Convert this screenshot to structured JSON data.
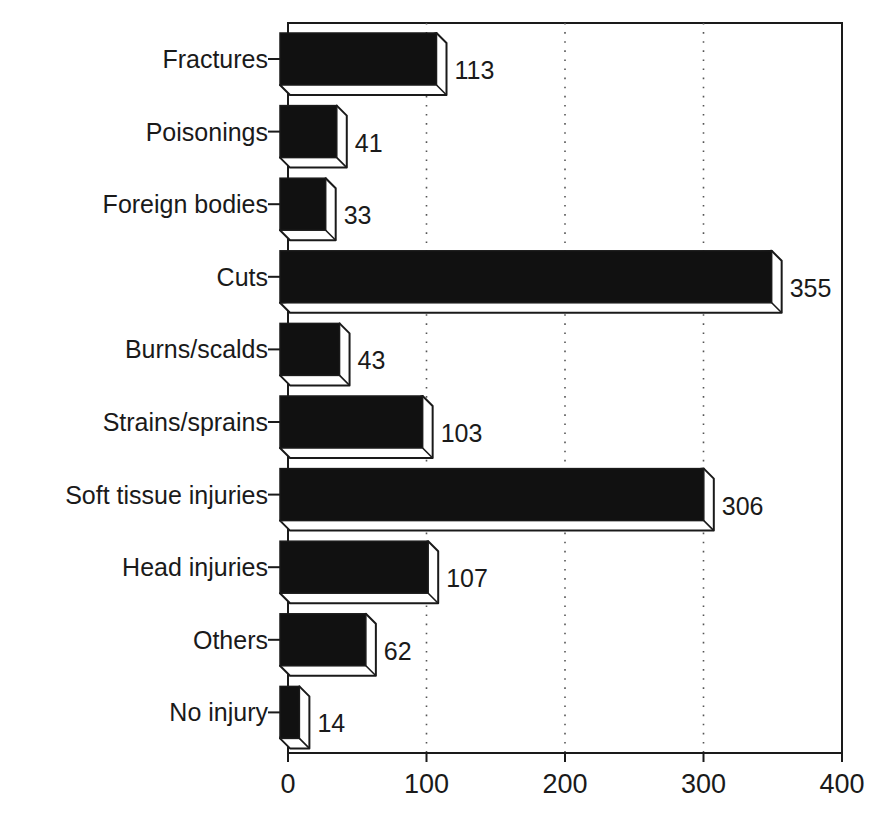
{
  "chart_data": {
    "type": "bar",
    "orientation": "horizontal",
    "style": "3d-bevel",
    "title": "",
    "xlabel": "",
    "ylabel": "",
    "categories": [
      "Fractures",
      "Poisonings",
      "Foreign bodies",
      "Cuts",
      "Burns/scalds",
      "Strains/sprains",
      "Soft tissue injuries",
      "Head injuries",
      "Others",
      "No injury"
    ],
    "values": [
      113,
      41,
      33,
      355,
      43,
      103,
      306,
      107,
      62,
      14
    ],
    "data_labels": [
      "113",
      "41",
      "33",
      "355",
      "43",
      "103",
      "306",
      "107",
      "62",
      "14"
    ],
    "xlim": [
      0,
      400
    ],
    "x_ticks": [
      0,
      100,
      200,
      300,
      400
    ],
    "x_tick_labels": [
      "0",
      "100",
      "200",
      "300",
      "400"
    ],
    "grid": {
      "vertical": true,
      "style": "dotted",
      "at": [
        100,
        200,
        300
      ]
    },
    "legend": null,
    "colors": {
      "bar_face": "#111111",
      "bar_bevel": "#ffffff",
      "outline": "#1a1a1a",
      "grid": "#555555"
    }
  }
}
